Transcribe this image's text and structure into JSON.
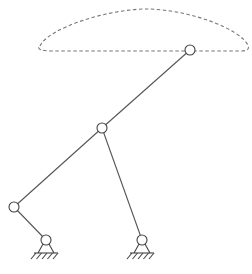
{
  "diagram": {
    "type": "four-bar-linkage-coupler-curve",
    "colors": {
      "background": "#ffffff",
      "link": "#555555",
      "joint": "#444444",
      "curve": "#777777"
    },
    "coupler_curve": {
      "style": "dashed",
      "path": "M 40 46 C 48 28, 110 8, 150 9 C 195 11, 240 30, 248 45 C 250 50, 246 51, 240 51 L 52 51 C 42 51, 36 49, 40 46 Z"
    },
    "joints": [
      {
        "id": "coupler-point",
        "x": 190,
        "y": 50,
        "r": 5
      },
      {
        "id": "coupler-joint",
        "x": 102,
        "y": 128,
        "r": 5
      },
      {
        "id": "crank-joint",
        "x": 14,
        "y": 207,
        "r": 5
      },
      {
        "id": "ground-pivot-left",
        "x": 46,
        "y": 240,
        "r": 5
      },
      {
        "id": "ground-pivot-right",
        "x": 142,
        "y": 240,
        "r": 5
      }
    ],
    "links": [
      {
        "id": "coupler-extension",
        "from": "coupler-point",
        "to": "coupler-joint"
      },
      {
        "id": "coupler",
        "from": "coupler-joint",
        "to": "crank-joint"
      },
      {
        "id": "crank",
        "from": "crank-joint",
        "to": "ground-pivot-left"
      },
      {
        "id": "rocker",
        "from": "coupler-joint",
        "to": "ground-pivot-right"
      }
    ],
    "grounds": [
      {
        "id": "ground-left",
        "x": 46,
        "y": 240
      },
      {
        "id": "ground-right",
        "x": 142,
        "y": 240
      }
    ]
  }
}
